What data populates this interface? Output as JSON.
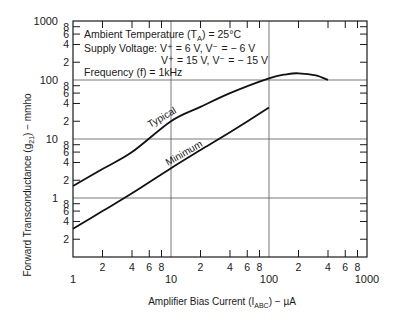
{
  "chart_data": {
    "type": "line",
    "title": "",
    "xlabel": "Amplifier Bias Current (I_ABC) − µA",
    "ylabel": "Forward Transconductance (g21) − mmho",
    "xscale": "log",
    "yscale": "log",
    "xlim": [
      1,
      1000
    ],
    "ylim": [
      0.1,
      1000
    ],
    "grid": true,
    "x_major_ticks": [
      "1",
      "10",
      "100",
      "1000"
    ],
    "x_minor_ticks": [
      "2",
      "4",
      "6",
      "8"
    ],
    "y_major_ticks": [
      "1000",
      "100",
      "10",
      "1"
    ],
    "y_minor_ticks": [
      "8",
      "6",
      "4",
      "2"
    ],
    "annotations": [
      "Ambient Temperature (TA) = 25°C",
      "Supply Voltage: V+ = 6 V, V− = − 6 V",
      "V+ = 15 V, V− = − 15 V",
      "Frequency (f) = 1kHz"
    ],
    "series": [
      {
        "name": "Typical",
        "x": [
          1,
          2,
          4,
          10,
          20,
          40,
          100,
          150,
          200,
          300,
          400
        ],
        "values": [
          1.6,
          3.1,
          6.0,
          20,
          35,
          60,
          107,
          125,
          130,
          120,
          100
        ]
      },
      {
        "name": "Minimum",
        "x": [
          1,
          2,
          4,
          10,
          20,
          40,
          100
        ],
        "values": [
          0.3,
          0.6,
          1.2,
          3.2,
          6.5,
          13,
          34
        ]
      }
    ]
  },
  "labels": {
    "x_axis_title_main": "Amplifier Bias Current (I",
    "x_axis_title_sub": "ABC",
    "x_axis_title_tail": ") − µA",
    "y_axis_title_main": "Forward Transconductance (g",
    "y_axis_title_sub": "21",
    "y_axis_title_tail": ") − mmho",
    "ann1_main": "Ambient Temperature (T",
    "ann1_sub": "A",
    "ann1_tail": ") = 25°C",
    "ann2": "Supply Voltage: V⁺ = 6 V, V⁻ = − 6 V",
    "ann3": "V⁺ = 15 V, V⁻ = − 15 V",
    "ann4": "Frequency (f) = 1kHz",
    "curve_typical": "Typical",
    "curve_minimum": "Minimum"
  }
}
